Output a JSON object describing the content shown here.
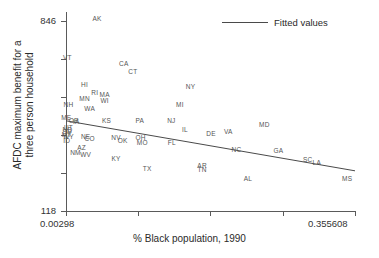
{
  "chart_data": {
    "type": "scatter",
    "title": "",
    "xlabel": "% Black population, 1990",
    "ylabel": "AFDC maximum benefit for a three person household",
    "ylabel_line1": "AFDC maximum benefit for a",
    "ylabel_line2": "three person household",
    "xlim": [
      0.00298,
      0.355608
    ],
    "ylim": [
      118,
      846
    ],
    "xticklabels": [
      "0.00298",
      "0.355608"
    ],
    "yticklabels": [
      "846",
      "118"
    ],
    "grid": false,
    "legend_position": "top-right",
    "legend": [
      {
        "label": "Fitted values",
        "type": "line",
        "color": "#4a4a4a"
      }
    ],
    "point_label_field": "state",
    "series": [
      {
        "name": "States",
        "points": [
          {
            "state": "AK",
            "x": 0.0409,
            "y": 823
          },
          {
            "state": "VT",
            "x": 0.0045,
            "y": 680
          },
          {
            "state": "CA",
            "x": 0.0735,
            "y": 660
          },
          {
            "state": "CT",
            "x": 0.0846,
            "y": 629
          },
          {
            "state": "HI",
            "x": 0.0256,
            "y": 582
          },
          {
            "state": "RI",
            "x": 0.038,
            "y": 554
          },
          {
            "state": "MA",
            "x": 0.0501,
            "y": 546
          },
          {
            "state": "MN",
            "x": 0.0256,
            "y": 531
          },
          {
            "state": "WI",
            "x": 0.0501,
            "y": 523
          },
          {
            "state": "WA",
            "x": 0.0318,
            "y": 496
          },
          {
            "state": "NH",
            "x": 0.006,
            "y": 508
          },
          {
            "state": "NY",
            "x": 0.155,
            "y": 577
          },
          {
            "state": "MI",
            "x": 0.142,
            "y": 508
          },
          {
            "state": "ME",
            "x": 0.0033,
            "y": 462
          },
          {
            "state": "OR",
            "x": 0.0125,
            "y": 450
          },
          {
            "state": "IA",
            "x": 0.0155,
            "y": 446
          },
          {
            "state": "UT",
            "x": 0.006,
            "y": 427
          },
          {
            "state": "ND",
            "x": 0.0048,
            "y": 418
          },
          {
            "state": "SD",
            "x": 0.0045,
            "y": 409
          },
          {
            "state": "MT",
            "x": 0.0037,
            "y": 400
          },
          {
            "state": "WY",
            "x": 0.006,
            "y": 392
          },
          {
            "state": "ID",
            "x": 0.0037,
            "y": 377
          },
          {
            "state": "KS",
            "x": 0.0524,
            "y": 450
          },
          {
            "state": "PA",
            "x": 0.093,
            "y": 452
          },
          {
            "state": "NJ",
            "x": 0.1315,
            "y": 450
          },
          {
            "state": "IL",
            "x": 0.148,
            "y": 419
          },
          {
            "state": "DE",
            "x": 0.18,
            "y": 403
          },
          {
            "state": "VA",
            "x": 0.201,
            "y": 410
          },
          {
            "state": "MD",
            "x": 0.245,
            "y": 437
          },
          {
            "state": "NE",
            "x": 0.027,
            "y": 394
          },
          {
            "state": "CO",
            "x": 0.0318,
            "y": 384
          },
          {
            "state": "NV",
            "x": 0.064,
            "y": 389
          },
          {
            "state": "OH",
            "x": 0.094,
            "y": 389
          },
          {
            "state": "OK",
            "x": 0.072,
            "y": 377
          },
          {
            "state": "MO",
            "x": 0.096,
            "y": 369
          },
          {
            "state": "FL",
            "x": 0.132,
            "y": 369
          },
          {
            "state": "NC",
            "x": 0.211,
            "y": 343
          },
          {
            "state": "GA",
            "x": 0.262,
            "y": 341
          },
          {
            "state": "AZ",
            "x": 0.022,
            "y": 352
          },
          {
            "state": "NM",
            "x": 0.0145,
            "y": 334
          },
          {
            "state": "WV",
            "x": 0.027,
            "y": 326
          },
          {
            "state": "KY",
            "x": 0.064,
            "y": 311
          },
          {
            "state": "SC",
            "x": 0.298,
            "y": 308
          },
          {
            "state": "LA",
            "x": 0.309,
            "y": 299
          },
          {
            "state": "TX",
            "x": 0.102,
            "y": 277
          },
          {
            "state": "AR",
            "x": 0.169,
            "y": 285
          },
          {
            "state": "TN",
            "x": 0.169,
            "y": 272
          },
          {
            "state": "AL",
            "x": 0.225,
            "y": 240
          },
          {
            "state": "MS",
            "x": 0.346,
            "y": 240
          }
        ]
      }
    ],
    "fit_line": {
      "label": "Fitted values",
      "color": "#4a4a4a",
      "x_start": 0.00298,
      "x_end": 0.355608,
      "y_start": 448,
      "y_end": 265
    }
  }
}
